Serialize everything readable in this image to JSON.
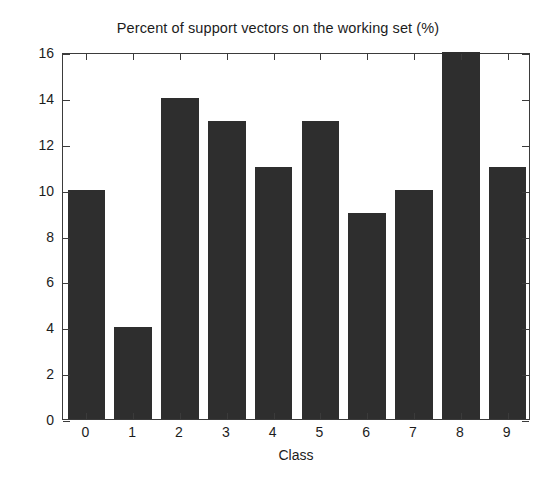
{
  "chart_data": {
    "type": "bar",
    "title": "Percent of support vectors on the working set (%)",
    "xlabel": "Class",
    "ylabel": "",
    "categories": [
      "0",
      "1",
      "2",
      "3",
      "4",
      "5",
      "6",
      "7",
      "8",
      "9"
    ],
    "values": [
      10,
      4,
      14,
      13,
      11,
      13,
      9,
      10,
      16,
      11
    ],
    "ylim": [
      0,
      16
    ],
    "xlim": [
      -0.5,
      9.5
    ],
    "ytick_labels": [
      "0",
      "2",
      "4",
      "6",
      "8",
      "10",
      "12",
      "14",
      "16"
    ],
    "ytick_values": [
      0,
      2,
      4,
      6,
      8,
      10,
      12,
      14,
      16
    ],
    "xtick_labels": [
      "0",
      "1",
      "2",
      "3",
      "4",
      "5",
      "6",
      "7",
      "8",
      "9"
    ],
    "grid": false,
    "legend": null,
    "bar_color": "#2e2e2e",
    "axis_color": "#3b3b3b",
    "background_color": "#ffffff"
  },
  "figure": {
    "title": "Percent of support vectors on the working set (%)",
    "xaxis_title": "Class"
  }
}
